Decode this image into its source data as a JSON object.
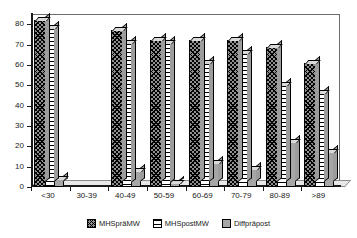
{
  "chart_data": {
    "type": "bar",
    "title": "",
    "subtitle": "",
    "xlabel": "",
    "ylabel": "",
    "ylim": [
      0,
      85
    ],
    "yticks": [
      0,
      10,
      20,
      30,
      40,
      50,
      60,
      70,
      80
    ],
    "grid": false,
    "legend_position": "bottom",
    "style": "3d-grayscale-hatched",
    "categories": [
      "<30",
      "30-39",
      "40-49",
      "50-59",
      "60-69",
      "70-79",
      "80-89",
      ">89"
    ],
    "series": [
      {
        "name": "MHSpräMW",
        "pattern": "cross-hatch",
        "color": "#8f8f8f",
        "values": [
          82,
          0,
          77,
          72,
          72,
          72,
          69,
          61
        ]
      },
      {
        "name": "MHSpostMW",
        "pattern": "horizontal-stripes",
        "color": "#ffffff",
        "values": [
          78,
          0,
          71,
          71,
          61,
          66,
          50,
          46
        ]
      },
      {
        "name": "Diffpräpost",
        "pattern": "solid-gray",
        "color": "#a6a6a6",
        "values": [
          4,
          0,
          8,
          2,
          12,
          9,
          22,
          17
        ]
      }
    ]
  },
  "legend": {
    "items": [
      {
        "label": "MHSpräMW",
        "swatch": "cross-hatch-swatch"
      },
      {
        "label": "MHSpostMW",
        "swatch": "horizontal-stripes-swatch"
      },
      {
        "label": "Diffpräpost",
        "swatch": "solid-gray-swatch"
      }
    ]
  },
  "axes": {
    "y_tick_labels": [
      "80",
      "70",
      "60",
      "50",
      "40",
      "30",
      "20",
      "10",
      "0"
    ],
    "x_tick_labels": [
      "<30",
      "30-39",
      "40-49",
      "50-59",
      "60-69",
      "70-79",
      "80-89",
      ">89"
    ]
  }
}
